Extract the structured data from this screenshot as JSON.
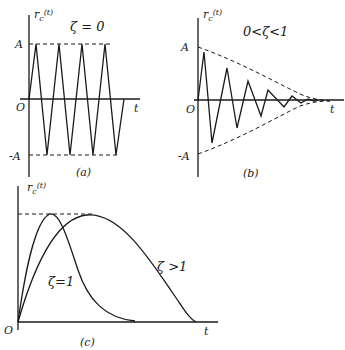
{
  "figure": {
    "panel_a": {
      "caption": "(a)",
      "ylabel": "r",
      "ylabel_sub": "c",
      "ylabel_arg": "(t)",
      "condition": "ζ = 0",
      "tick_A": "A",
      "tick_zero": "O",
      "tick_negA": "-A",
      "xlabel": "t"
    },
    "panel_b": {
      "caption": "(b)",
      "ylabel": "r",
      "ylabel_sub": "c",
      "ylabel_arg": "(t)",
      "condition": "0<ζ<1",
      "tick_A": "A",
      "tick_zero": "O",
      "tick_negA": "-A",
      "xlabel": "t"
    },
    "panel_c": {
      "caption": "(c)",
      "ylabel": "r",
      "ylabel_sub": "c",
      "ylabel_arg": "(t)",
      "curve1_label": "ζ=1",
      "curve2_label": "ζ >1",
      "tick_zero": "O",
      "xlabel": "t"
    }
  }
}
